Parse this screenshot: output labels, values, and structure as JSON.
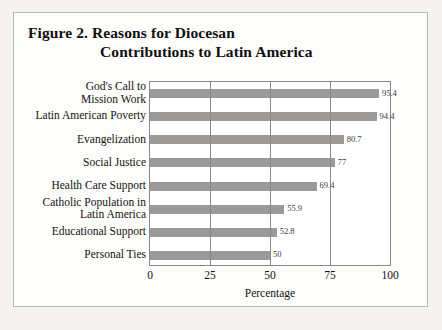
{
  "figure": {
    "title_line_1": "Figure 2.  Reasons for Diocesan",
    "title_line_2": "Contributions to Latin America",
    "axis_title": "Percentage",
    "bar_color": "#9c9a99",
    "frame_color": "#8b8986",
    "plot_background": "#ffffff",
    "page_background": "#f4f3f1"
  },
  "chart_data": {
    "type": "bar",
    "orientation": "horizontal",
    "title": "Figure 2.  Reasons for Diocesan Contributions to Latin America",
    "xlabel": "Percentage",
    "ylabel": "",
    "xlim": [
      0,
      100
    ],
    "xticks": [
      "0",
      "25",
      "50",
      "75",
      "100"
    ],
    "grid": "vertical",
    "legend": "none",
    "categories": [
      "God's Call to\nMission Work",
      "Latin American Poverty",
      "Evangelization",
      "Social Justice",
      "Health Care Support",
      "Catholic Population in\nLatin America",
      "Educational Support",
      "Personal Ties"
    ],
    "values": [
      95.4,
      94.4,
      80.7,
      77,
      69.4,
      55.9,
      52.8,
      50
    ],
    "value_labels": [
      "95.4",
      "94.4",
      "80.7",
      "77",
      "69.4",
      "55.9",
      "52.8",
      "50"
    ]
  }
}
